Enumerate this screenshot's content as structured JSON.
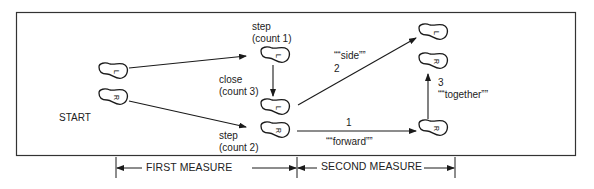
{
  "diagram": {
    "start_label": "START",
    "feet": [
      {
        "id": "start-left",
        "letter": "L"
      },
      {
        "id": "start-right",
        "letter": "R"
      },
      {
        "id": "step1-left",
        "letter": "L"
      },
      {
        "id": "close3-left",
        "letter": "L"
      },
      {
        "id": "step2-right",
        "letter": "R"
      },
      {
        "id": "side-left",
        "letter": "L"
      },
      {
        "id": "together-right",
        "letter": "R"
      },
      {
        "id": "forward-right",
        "letter": "R"
      }
    ],
    "labels": {
      "step_count1_line1": "step",
      "step_count1_line2": "(count 1)",
      "close_count3_line1": "close",
      "close_count3_line2": "(count 3)",
      "step_count2_line1": "step",
      "step_count2_line2": "(count 2)",
      "side_line1": "““side””",
      "side_line2": "2",
      "forward_num": "1",
      "forward_word": "““forward””",
      "together_num": "3",
      "together_word": "““together””"
    },
    "measures": {
      "first": "FIRST MEASURE",
      "second": "SECOND MEASURE"
    },
    "colors": {
      "ink": "#1a1a1a",
      "background": "#ffffff"
    }
  }
}
